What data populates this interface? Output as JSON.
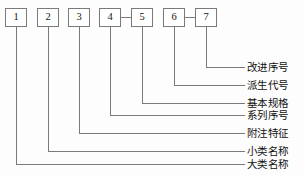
{
  "diagram": {
    "type": "leader-line-callout-diagram",
    "stroke_color": "#7a7a7a",
    "text_color": "#101010",
    "background": "#fdfdfd",
    "boxes": [
      {
        "id": "box-1",
        "label": "1",
        "x": 5,
        "y": 8,
        "connector_to_next": false
      },
      {
        "id": "box-2",
        "label": "2",
        "x": 37,
        "y": 8,
        "connector_to_next": false
      },
      {
        "id": "box-3",
        "label": "3",
        "x": 68,
        "y": 8,
        "connector_to_next": false
      },
      {
        "id": "box-4",
        "label": "4",
        "x": 99,
        "y": 8,
        "connector_to_next": true
      },
      {
        "id": "box-5",
        "label": "5",
        "x": 131,
        "y": 8,
        "connector_to_next": false
      },
      {
        "id": "box-6",
        "label": "6",
        "x": 163,
        "y": 8,
        "connector_to_next": true
      },
      {
        "id": "box-7",
        "label": "7",
        "x": 195,
        "y": 8,
        "connector_to_next": false
      }
    ],
    "callouts": [
      {
        "id": "callout-7",
        "box": "7",
        "text": "改进序号",
        "line_y": 67,
        "label_y": 62
      },
      {
        "id": "callout-6",
        "box": "6",
        "text": "派生代号",
        "line_y": 85,
        "label_y": 80
      },
      {
        "id": "callout-5",
        "box": "5",
        "text": "基本规格",
        "line_y": 103,
        "label_y": 98
      },
      {
        "id": "callout-4",
        "box": "4",
        "text": "系列序号",
        "line_y": 115,
        "label_y": 110
      },
      {
        "id": "callout-3",
        "box": "3",
        "text": "附注特征",
        "line_y": 133,
        "label_y": 128
      },
      {
        "id": "callout-2",
        "box": "2",
        "text": "小类名称",
        "line_y": 151,
        "label_y": 146
      },
      {
        "id": "callout-1",
        "box": "1",
        "text": "大类名称",
        "line_y": 164,
        "label_y": 159
      }
    ]
  }
}
